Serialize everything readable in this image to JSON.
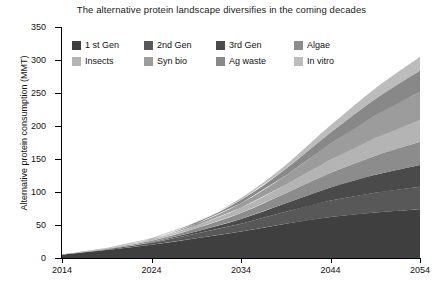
{
  "chart_data": {
    "type": "area",
    "title": "The alternative protein landscape diversifies in the coming decades",
    "xlabel": "",
    "ylabel": "Alternative protein consumption (MMT)",
    "xlim": [
      2014,
      2054
    ],
    "ylim": [
      0,
      350
    ],
    "xticks": [
      2014,
      2024,
      2034,
      2044,
      2054
    ],
    "yticks": [
      0,
      50,
      100,
      150,
      200,
      250,
      300,
      350
    ],
    "grid": false,
    "legend_position": "top-left-inside",
    "stacked": true,
    "x": [
      2014,
      2019,
      2024,
      2029,
      2034,
      2039,
      2044,
      2049,
      2054
    ],
    "series": [
      {
        "name": "1 st Gen",
        "color": "#3f3f3f",
        "values": [
          5,
          12,
          20,
          30,
          40,
          52,
          62,
          69,
          74
        ]
      },
      {
        "name": "2nd Gen",
        "color": "#585858",
        "values": [
          0,
          1,
          3,
          7,
          12,
          18,
          25,
          30,
          34
        ]
      },
      {
        "name": "3rd Gen",
        "color": "#4a4a4a",
        "values": [
          0,
          0,
          1,
          3,
          7,
          13,
          20,
          27,
          33
        ]
      },
      {
        "name": "Algae",
        "color": "#8c8c8c",
        "values": [
          0,
          1,
          2,
          5,
          9,
          15,
          22,
          29,
          35
        ]
      },
      {
        "name": "Insects",
        "color": "#b4b4b4",
        "values": [
          0,
          1,
          2,
          4,
          8,
          13,
          20,
          27,
          33
        ]
      },
      {
        "name": "Syn bio",
        "color": "#9c9c9c",
        "values": [
          0,
          0,
          1,
          3,
          7,
          14,
          24,
          34,
          43
        ]
      },
      {
        "name": "Ag waste",
        "color": "#888888",
        "values": [
          0,
          0,
          1,
          2,
          5,
          10,
          17,
          25,
          32
        ]
      },
      {
        "name": "In vitro",
        "color": "#bcbcbc",
        "values": [
          0,
          0,
          0,
          1,
          3,
          6,
          11,
          16,
          21
        ]
      }
    ],
    "totals": [
      5,
      15,
      30,
      55,
      91,
      141,
      201,
      257,
      305
    ]
  },
  "legend": {
    "rows": [
      [
        {
          "label": "1 st Gen",
          "color": "#3f3f3f"
        },
        {
          "label": "2nd Gen",
          "color": "#585858"
        },
        {
          "label": "3rd Gen",
          "color": "#4a4a4a"
        },
        {
          "label": "Algae",
          "color": "#8c8c8c"
        }
      ],
      [
        {
          "label": "Insects",
          "color": "#b4b4b4"
        },
        {
          "label": "Syn bio",
          "color": "#9c9c9c"
        },
        {
          "label": "Ag waste",
          "color": "#888888"
        },
        {
          "label": "In vitro",
          "color": "#bcbcbc"
        }
      ]
    ]
  },
  "axes": {
    "y_title": "Alternative protein consumption (MMT)",
    "y_labels": [
      "350",
      "300",
      "250",
      "200",
      "150",
      "100",
      "50",
      "0"
    ],
    "x_labels": [
      "2014",
      "2024",
      "2034",
      "2044",
      "2054"
    ]
  }
}
